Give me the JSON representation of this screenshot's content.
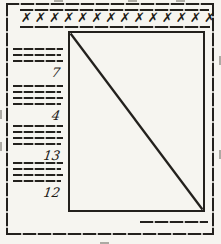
{
  "figure": {
    "ink_color": "#23211d",
    "paper_color": "#f6f5f0",
    "header": {
      "x_marks": "✗✗✗✗✗✗✗✗✗✗✗✗✗✗",
      "x_count": 14
    },
    "left_column": {
      "groups": [
        {
          "label": "7",
          "line_count": 3
        },
        {
          "label": "4",
          "line_count": 4
        },
        {
          "label": "13",
          "line_count": 4
        },
        {
          "label": "12",
          "line_count": 4
        }
      ]
    },
    "placeholder_box": {
      "diagonal": "top-left-to-bottom-right"
    }
  }
}
